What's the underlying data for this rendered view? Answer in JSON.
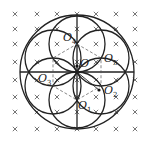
{
  "figure": {
    "type": "magnetic-field-circles",
    "field_symbol": "×",
    "labels": {
      "O": "O",
      "O1": {
        "base": "O",
        "sub": "1"
      },
      "O2": {
        "base": "O",
        "sub": "2"
      },
      "O3": {
        "base": "O",
        "sub": "3"
      },
      "O4": {
        "base": "O",
        "sub": "4"
      },
      "O5": {
        "base": "O",
        "sub": "5"
      },
      "O6": {
        "base": "O",
        "sub": "6"
      }
    },
    "colors": {
      "line": "#222222",
      "cross": "#555555",
      "background": "#ffffff"
    }
  }
}
